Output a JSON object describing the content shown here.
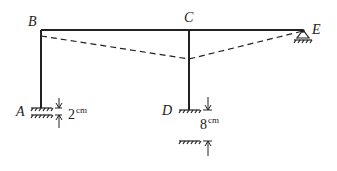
{
  "diagram": {
    "type": "structural-frame-settlement",
    "nodes": {
      "B": {
        "label": "B"
      },
      "C": {
        "label": "C"
      },
      "E": {
        "label": "E"
      },
      "A": {
        "label": "A"
      },
      "D": {
        "label": "D"
      }
    },
    "members": [
      "A-B",
      "B-C",
      "C-E",
      "C-D"
    ],
    "supports": {
      "A": "fixed-settled",
      "D": "fixed-settled",
      "E": "pin"
    },
    "settlements": {
      "A": {
        "value": "2",
        "unit": "cm"
      },
      "D": {
        "value": "8",
        "unit": "cm"
      }
    },
    "deflected_shape": "dashed line B → below C → E",
    "colors": {
      "line": "#222222",
      "background": "#ffffff"
    }
  }
}
